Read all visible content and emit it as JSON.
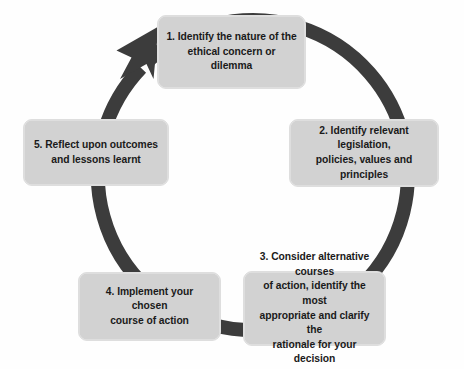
{
  "diagram": {
    "type": "circular-process-cycle",
    "direction": "clockwise",
    "background_color": "#fefefe",
    "ring": {
      "name": "cycle-arrow-ring",
      "color": "#3c3c3c",
      "center_x": 233,
      "center_y": 182,
      "radius": 155,
      "stroke_width": 14,
      "arrowhead_position": "top-left",
      "arrowhead_points_to": "step-1"
    },
    "box_style": {
      "fill": "#d2d2d2",
      "border": "#dedede",
      "text_color": "#1a1a1a",
      "corner_radius": 9
    },
    "steps": [
      {
        "number": "1",
        "id": "step-1",
        "text": "1. Identify the nature of the\nethical concern or dilemma"
      },
      {
        "number": "2",
        "id": "step-2",
        "text": "2. Identify relevant legislation,\npolicies, values and principles"
      },
      {
        "number": "3",
        "id": "step-3",
        "text": "3. Consider alternative courses\nof action, identify the most\nappropriate and clarify the\nrationale for your decision"
      },
      {
        "number": "4",
        "id": "step-4",
        "text": "4. Implement your chosen\ncourse of action"
      },
      {
        "number": "5",
        "id": "step-5",
        "text": "5. Reflect upon outcomes\nand lessons learnt"
      }
    ]
  }
}
